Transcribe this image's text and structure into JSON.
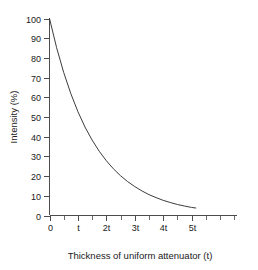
{
  "chart_data": {
    "type": "line",
    "title": "",
    "xlabel": "Thickness of uniform attenuator (t)",
    "ylabel": "Intensity (%)",
    "x_tick_labels": [
      "0",
      "t",
      "2t",
      "3t",
      "4t",
      "5t"
    ],
    "x_tick_values": [
      0,
      1,
      2,
      3,
      4,
      5
    ],
    "y_tick_labels": [
      "0",
      "10",
      "20",
      "30",
      "40",
      "50",
      "60",
      "70",
      "80",
      "90",
      "100"
    ],
    "y_tick_values": [
      0,
      10,
      20,
      30,
      40,
      50,
      60,
      70,
      80,
      90,
      100
    ],
    "xlim": [
      0,
      6.6
    ],
    "ylim": [
      0,
      100
    ],
    "grid": false,
    "legend": null,
    "minor_ticks_per_interval": 1,
    "series": [
      {
        "name": "Transmitted intensity",
        "x": [
          0,
          0.25,
          0.5,
          0.75,
          1,
          1.25,
          1.5,
          1.75,
          2,
          2.25,
          2.5,
          2.75,
          3,
          3.25,
          3.5,
          3.75,
          4,
          4.25,
          4.5,
          4.75,
          5,
          5.15
        ],
        "values": [
          100,
          85.2,
          72.6,
          61.9,
          52.7,
          44.9,
          38.3,
          32.6,
          27.8,
          23.7,
          20.2,
          17.2,
          14.7,
          12.5,
          10.6,
          9.1,
          7.7,
          6.6,
          5.6,
          4.8,
          4.1,
          3.8
        ]
      }
    ]
  },
  "colors": {
    "curve": "#3c3c3c",
    "axis": "#4d4d4d",
    "text": "#1a1a1a",
    "background": "#ffffff"
  }
}
